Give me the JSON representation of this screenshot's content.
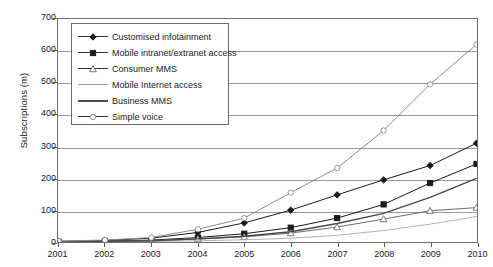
{
  "chart_data": {
    "type": "line",
    "title": "",
    "xlabel": "",
    "ylabel": "Subscriptions (m)",
    "categories": [
      "2001",
      "2002",
      "2003",
      "2004",
      "2005",
      "2006",
      "2007",
      "2008",
      "2009",
      "2010"
    ],
    "x": [
      2001,
      2002,
      2003,
      2004,
      2005,
      2006,
      2007,
      2008,
      2009,
      2010
    ],
    "xlim": [
      2001,
      2010
    ],
    "ylim": [
      0,
      700
    ],
    "yticks": [
      0,
      100,
      200,
      300,
      400,
      500,
      600,
      700
    ],
    "grid": "horizontal",
    "legend_position": "top-left",
    "series": [
      {
        "name": "Customised infotainment",
        "marker": "filled-diamond",
        "color": "#1a1a1a",
        "values": [
          2,
          5,
          12,
          30,
          60,
          100,
          148,
          195,
          240,
          310
        ]
      },
      {
        "name": "Mobile intranet/extranet access",
        "marker": "filled-square",
        "color": "#1a1a1a",
        "values": [
          1,
          3,
          6,
          14,
          26,
          45,
          75,
          118,
          185,
          245
        ]
      },
      {
        "name": "Consumer MMS",
        "marker": "open-triangle",
        "color": "#6b6b6b",
        "values": [
          1,
          2,
          4,
          9,
          16,
          28,
          47,
          72,
          98,
          108
        ]
      },
      {
        "name": "Mobile Internet access",
        "marker": "none",
        "color": "#a8a8a8",
        "values": [
          0,
          1,
          2,
          4,
          7,
          12,
          21,
          36,
          56,
          80
        ]
      },
      {
        "name": "Business MMS",
        "marker": "none",
        "color": "#4a4a4a",
        "values": [
          1,
          2,
          4,
          10,
          18,
          32,
          58,
          90,
          140,
          200
        ]
      },
      {
        "name": "Simple voice",
        "marker": "open-circle",
        "color": "#8a8a8a",
        "values": [
          3,
          6,
          14,
          40,
          75,
          155,
          232,
          350,
          495,
          620
        ]
      }
    ]
  },
  "legend": {
    "items": [
      {
        "label": "Customised infotainment",
        "key": "filled-diamond"
      },
      {
        "label": "Mobile intranet/extranet access",
        "key": "filled-square"
      },
      {
        "label": "Consumer MMS",
        "key": "open-triangle"
      },
      {
        "label": "Mobile Internet access",
        "key": "thin-line"
      },
      {
        "label": "Business MMS",
        "key": "thick-line"
      },
      {
        "label": "Simple voice",
        "key": "open-circle"
      }
    ]
  }
}
